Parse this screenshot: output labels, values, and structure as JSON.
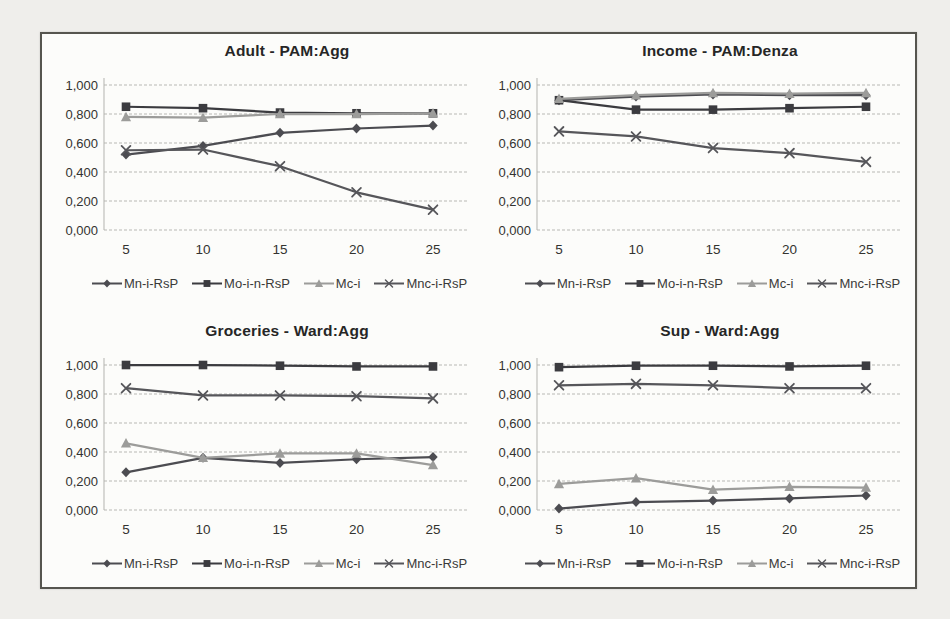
{
  "panel": {
    "background": "#fcfcfa",
    "border_color": "#56554f",
    "grid_color": "#b8b8b4",
    "axis_color": "#b3b3af",
    "text_color": "#333330"
  },
  "chart_data": [
    {
      "type": "line",
      "title": "Adult - PAM:Agg",
      "x": [
        5,
        10,
        15,
        20,
        25
      ],
      "xtick_labels": [
        "5",
        "10",
        "15",
        "20",
        "25"
      ],
      "ytick_labels": [
        "0,000",
        "0,200",
        "0,400",
        "0,600",
        "0,800",
        "1,000"
      ],
      "ylim": [
        0,
        1
      ],
      "grid": true,
      "legend_position": "bottom",
      "series": [
        {
          "name": "Mn-i-RsP",
          "marker": "diamond",
          "color": "#4c4c51",
          "values": [
            0.52,
            0.58,
            0.67,
            0.7,
            0.72
          ]
        },
        {
          "name": "Mo-i-n-RsP",
          "marker": "square",
          "color": "#3b3b3f",
          "values": [
            0.85,
            0.84,
            0.81,
            0.805,
            0.805
          ]
        },
        {
          "name": "Mc-i",
          "marker": "triangle",
          "color": "#9c9c9a",
          "values": [
            0.78,
            0.775,
            0.8,
            0.8,
            0.805
          ]
        },
        {
          "name": "Mnc-i-RsP",
          "marker": "x",
          "color": "#56565a",
          "values": [
            0.55,
            0.555,
            0.44,
            0.26,
            0.14
          ]
        }
      ]
    },
    {
      "type": "line",
      "title": "Income - PAM:Denza",
      "x": [
        5,
        10,
        15,
        20,
        25
      ],
      "xtick_labels": [
        "5",
        "10",
        "15",
        "20",
        "25"
      ],
      "ytick_labels": [
        "0,000",
        "0,200",
        "0,400",
        "0,600",
        "0,800",
        "1,000"
      ],
      "ylim": [
        0,
        1
      ],
      "grid": true,
      "legend_position": "bottom",
      "series": [
        {
          "name": "Mn-i-RsP",
          "marker": "diamond",
          "color": "#4c4c51",
          "values": [
            0.895,
            0.92,
            0.935,
            0.93,
            0.93
          ]
        },
        {
          "name": "Mo-i-n-RsP",
          "marker": "square",
          "color": "#3b3b3f",
          "values": [
            0.895,
            0.83,
            0.83,
            0.84,
            0.85
          ]
        },
        {
          "name": "Mc-i",
          "marker": "triangle",
          "color": "#9c9c9a",
          "values": [
            0.905,
            0.93,
            0.945,
            0.94,
            0.945
          ]
        },
        {
          "name": "Mnc-i-RsP",
          "marker": "x",
          "color": "#56565a",
          "values": [
            0.68,
            0.645,
            0.565,
            0.53,
            0.47
          ]
        }
      ]
    },
    {
      "type": "line",
      "title": "Groceries - Ward:Agg",
      "x": [
        5,
        10,
        15,
        20,
        25
      ],
      "xtick_labels": [
        "5",
        "10",
        "15",
        "20",
        "25"
      ],
      "ytick_labels": [
        "0,000",
        "0,200",
        "0,400",
        "0,600",
        "0,800",
        "1,000"
      ],
      "ylim": [
        0,
        1
      ],
      "grid": true,
      "legend_position": "bottom",
      "series": [
        {
          "name": "Mn-i-RsP",
          "marker": "diamond",
          "color": "#4c4c51",
          "values": [
            0.26,
            0.36,
            0.325,
            0.35,
            0.365
          ]
        },
        {
          "name": "Mo-i-n-RsP",
          "marker": "square",
          "color": "#3b3b3f",
          "values": [
            1.0,
            1.0,
            0.995,
            0.99,
            0.99
          ]
        },
        {
          "name": "Mc-i",
          "marker": "triangle",
          "color": "#9c9c9a",
          "values": [
            0.46,
            0.36,
            0.39,
            0.39,
            0.31
          ]
        },
        {
          "name": "Mnc-i-RsP",
          "marker": "x",
          "color": "#56565a",
          "values": [
            0.84,
            0.79,
            0.79,
            0.785,
            0.77
          ]
        }
      ]
    },
    {
      "type": "line",
      "title": "Sup - Ward:Agg",
      "x": [
        5,
        10,
        15,
        20,
        25
      ],
      "xtick_labels": [
        "5",
        "10",
        "15",
        "20",
        "25"
      ],
      "ytick_labels": [
        "0,000",
        "0,200",
        "0,400",
        "0,600",
        "0,800",
        "1,000"
      ],
      "ylim": [
        0,
        1
      ],
      "grid": true,
      "legend_position": "bottom",
      "series": [
        {
          "name": "Mn-i-RsP",
          "marker": "diamond",
          "color": "#4c4c51",
          "values": [
            0.01,
            0.055,
            0.065,
            0.08,
            0.1
          ]
        },
        {
          "name": "Mo-i-n-RsP",
          "marker": "square",
          "color": "#3b3b3f",
          "values": [
            0.985,
            0.995,
            0.995,
            0.99,
            0.995
          ]
        },
        {
          "name": "Mc-i",
          "marker": "triangle",
          "color": "#9c9c9a",
          "values": [
            0.18,
            0.22,
            0.14,
            0.16,
            0.155
          ]
        },
        {
          "name": "Mnc-i-RsP",
          "marker": "x",
          "color": "#56565a",
          "values": [
            0.86,
            0.87,
            0.86,
            0.84,
            0.84
          ]
        }
      ]
    }
  ]
}
